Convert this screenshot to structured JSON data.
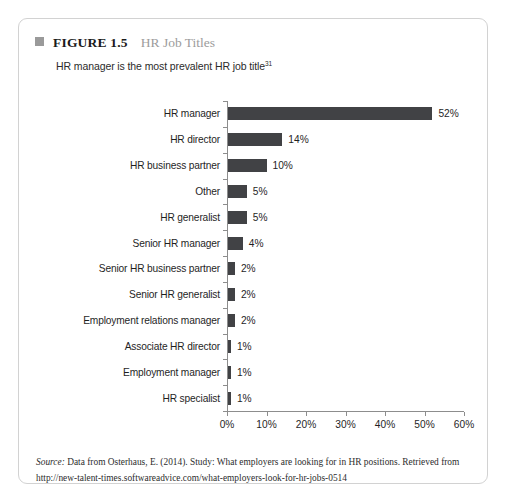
{
  "figure": {
    "marker_icon": "filled-square-icon",
    "number_label": "FIGURE 1.5",
    "title": "HR Job Titles",
    "subtitle": "HR manager is the most prevalent HR job title",
    "subtitle_footnote": "31"
  },
  "source": {
    "lead": "Source:",
    "text": " Data from Osterhaus, E. (2014). Study: What employers are looking for in HR positions. Retrieved from http://new-talent-times.softwareadvice.com/what-employers-look-for-hr-jobs-0514"
  },
  "colors": {
    "bar": "#414245",
    "axis": "#8d8d8d",
    "card_border": "#d2d2d2",
    "title_gray": "#9c9c9c",
    "marker_gray": "#9a9a9a"
  },
  "chart_data": {
    "type": "bar",
    "orientation": "horizontal",
    "title": "HR Job Titles",
    "subtitle": "HR manager is the most prevalent HR job title",
    "xlabel": "",
    "ylabel": "",
    "xlim": [
      0,
      60
    ],
    "xticks": [
      0,
      10,
      20,
      30,
      40,
      50,
      60
    ],
    "xtick_labels": [
      "0%",
      "10%",
      "20%",
      "30%",
      "40%",
      "50%",
      "60%"
    ],
    "grid": false,
    "legend": false,
    "value_suffix": "%",
    "categories": [
      "HR manager",
      "HR director",
      "HR business partner",
      "Other",
      "HR generalist",
      "Senior HR manager",
      "Senior HR business partner",
      "Senior HR generalist",
      "Employment relations manager",
      "Associate HR director",
      "Employment manager",
      "HR specialist"
    ],
    "values": [
      52,
      14,
      10,
      5,
      5,
      4,
      2,
      2,
      2,
      1,
      1,
      1
    ],
    "value_labels": [
      "52%",
      "14%",
      "10%",
      "5%",
      "5%",
      "4%",
      "2%",
      "2%",
      "2%",
      "1%",
      "1%",
      "1%"
    ]
  }
}
